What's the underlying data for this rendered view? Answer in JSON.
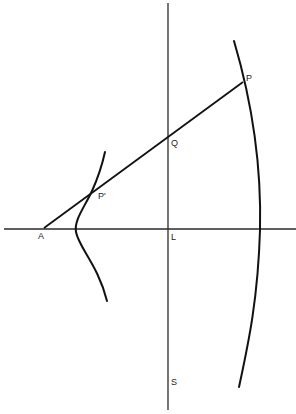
{
  "diagram": {
    "title": "",
    "colors": {
      "background": "#ffffff",
      "ink": "#111111",
      "axis": "#2a2a2a"
    },
    "labels": {
      "P": "P",
      "Q": "Q",
      "P_prime": "P'",
      "A": "A",
      "L": "L",
      "S": "S"
    },
    "points": [
      {
        "id": "P",
        "x": 243,
        "y": 82,
        "label": "P"
      },
      {
        "id": "Q",
        "x": 168,
        "y": 137,
        "label": "Q"
      },
      {
        "id": "P_prime",
        "x": 92,
        "y": 191,
        "label": "P'"
      },
      {
        "id": "A",
        "x": 44,
        "y": 228,
        "label": "A"
      },
      {
        "id": "L",
        "x": 168,
        "y": 229,
        "label": "L"
      },
      {
        "id": "S",
        "x": 168,
        "y": 380,
        "label": "S"
      }
    ],
    "elements": [
      {
        "type": "vertical-axis",
        "from": [
          168,
          3
        ],
        "to": [
          168,
          410
        ]
      },
      {
        "type": "horizontal-axis",
        "from": [
          4,
          229
        ],
        "to": [
          296,
          229
        ]
      },
      {
        "type": "segment",
        "name": "A-P",
        "from": [
          44,
          228
        ],
        "to": [
          243,
          82
        ]
      },
      {
        "type": "curve",
        "name": "right-curve",
        "through": [
          [
            234,
            41
          ],
          [
            243,
            82
          ],
          [
            260,
            230
          ],
          [
            239,
            387
          ]
        ]
      },
      {
        "type": "curve",
        "name": "left-curve",
        "through": [
          [
            105,
            152
          ],
          [
            92,
            191
          ],
          [
            76,
            229
          ],
          [
            107,
            301
          ]
        ]
      }
    ]
  }
}
